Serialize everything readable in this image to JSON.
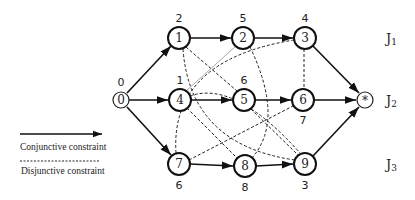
{
  "diagram": {
    "type": "disjunctive-graph",
    "nodes": [
      {
        "id": "0",
        "label": "0",
        "weight": "0",
        "x": 121,
        "y": 100,
        "r": 8
      },
      {
        "id": "1",
        "label": "1",
        "weight": "2",
        "x": 179,
        "y": 38,
        "r": 11
      },
      {
        "id": "2",
        "label": "2",
        "weight": "5",
        "x": 243,
        "y": 38,
        "r": 11
      },
      {
        "id": "3",
        "label": "3",
        "weight": "4",
        "x": 305,
        "y": 38,
        "r": 11
      },
      {
        "id": "4",
        "label": "4",
        "weight": "1",
        "x": 180,
        "y": 100,
        "r": 11
      },
      {
        "id": "5",
        "label": "5",
        "weight": "6",
        "x": 244,
        "y": 100,
        "r": 11
      },
      {
        "id": "6",
        "label": "6",
        "weight": "7",
        "x": 303,
        "y": 100,
        "r": 11
      },
      {
        "id": "7",
        "label": "7",
        "weight": "6",
        "x": 179,
        "y": 164,
        "r": 11
      },
      {
        "id": "8",
        "label": "8",
        "weight": "8",
        "x": 245,
        "y": 166,
        "r": 11
      },
      {
        "id": "9",
        "label": "9",
        "weight": "3",
        "x": 305,
        "y": 164,
        "r": 11
      },
      {
        "id": "*",
        "label": "*",
        "weight": "",
        "x": 365,
        "y": 100,
        "r": 8
      }
    ],
    "conjunctive_edges": [
      [
        "0",
        "1"
      ],
      [
        "0",
        "4"
      ],
      [
        "0",
        "7"
      ],
      [
        "1",
        "2"
      ],
      [
        "2",
        "3"
      ],
      [
        "3",
        "*"
      ],
      [
        "4",
        "5"
      ],
      [
        "5",
        "6"
      ],
      [
        "6",
        "*"
      ],
      [
        "7",
        "8"
      ],
      [
        "8",
        "9"
      ],
      [
        "9",
        "*"
      ]
    ],
    "disjunctive_edges": [
      [
        "1",
        "5"
      ],
      [
        "1",
        "9"
      ],
      [
        "3",
        "6"
      ],
      [
        "2",
        "8"
      ],
      [
        "7",
        "3"
      ],
      [
        "4",
        "8"
      ],
      [
        "7",
        "6"
      ],
      [
        "5",
        "9"
      ],
      [
        "4",
        "9"
      ]
    ],
    "light_edges": [
      [
        "4",
        "2"
      ]
    ],
    "jobs": [
      {
        "name": "J",
        "sub": "1",
        "y": 38
      },
      {
        "name": "J",
        "sub": "2",
        "y": 100
      },
      {
        "name": "J",
        "sub": "3",
        "y": 164
      }
    ]
  },
  "legend": {
    "conjunctive_label": "Conjunctive constraint",
    "disjunctive_label": "Disjunctive constraint"
  }
}
